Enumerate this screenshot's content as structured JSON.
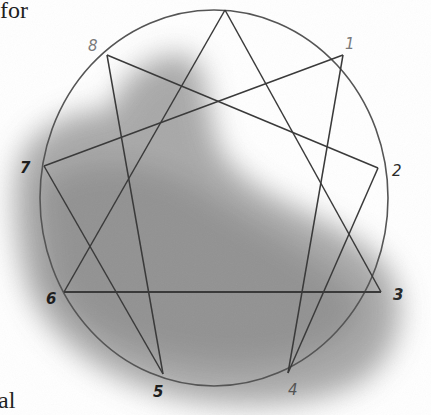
{
  "page_text": {
    "top_fragment": "for",
    "bottom_fragment": "al"
  },
  "diagram": {
    "type": "enneagram",
    "circle": {
      "cx": 215,
      "cy": 200,
      "r": 178
    },
    "colors": {
      "line": "#3a3a3a",
      "light_line": "#8a8a8a",
      "shade": "#8c8c8c",
      "label_dark": "#1e1e1e",
      "label_light": "#7a7a7a"
    },
    "points": [
      {
        "id": "9",
        "label": "",
        "x": 225,
        "y": 10
      },
      {
        "id": "1",
        "label": "1",
        "x": 343,
        "y": 55
      },
      {
        "id": "2",
        "label": "2",
        "x": 378,
        "y": 168
      },
      {
        "id": "3",
        "label": "3",
        "x": 381,
        "y": 292
      },
      {
        "id": "4",
        "label": "4",
        "x": 288,
        "y": 373
      },
      {
        "id": "5",
        "label": "5",
        "x": 163,
        "y": 374
      },
      {
        "id": "6",
        "label": "6",
        "x": 64,
        "y": 292
      },
      {
        "id": "7",
        "label": "7",
        "x": 44,
        "y": 166
      },
      {
        "id": "8",
        "label": "8",
        "x": 107,
        "y": 55
      }
    ],
    "triangle": [
      "9",
      "3",
      "6"
    ],
    "hexad": [
      "1",
      "4",
      "2",
      "8",
      "5",
      "7"
    ]
  }
}
